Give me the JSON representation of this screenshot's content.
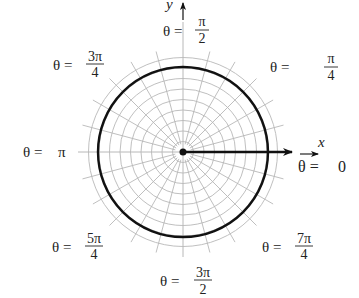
{
  "diagram": {
    "type": "polar-grid",
    "title": "",
    "axes": {
      "x_label": "x",
      "y_label": "y"
    },
    "grid": {
      "ring_count": 9,
      "spoke_step_degrees": 15
    },
    "curve": {
      "description": "circle r = constant",
      "radius_in_rings": 8.5,
      "color": "#111111"
    },
    "ray": {
      "description": "arrow along theta = 0",
      "color": "#111111"
    },
    "angle_labels": [
      {
        "id": "theta-0",
        "prefix": "θ = ",
        "value": "0",
        "fraction": false
      },
      {
        "id": "theta-pi-4",
        "prefix": "θ = ",
        "numerator": "π",
        "denominator": "4",
        "fraction": true
      },
      {
        "id": "theta-pi-2",
        "prefix": "θ = ",
        "numerator": "π",
        "denominator": "2",
        "fraction": true
      },
      {
        "id": "theta-3pi-4",
        "prefix": "θ = ",
        "numerator": "3π",
        "denominator": "4",
        "fraction": true
      },
      {
        "id": "theta-pi",
        "prefix": "θ = ",
        "value": "π",
        "fraction": false
      },
      {
        "id": "theta-5pi-4",
        "prefix": "θ = ",
        "numerator": "5π",
        "denominator": "4",
        "fraction": true
      },
      {
        "id": "theta-3pi-2",
        "prefix": "θ = ",
        "numerator": "3π",
        "denominator": "2",
        "fraction": true
      },
      {
        "id": "theta-7pi-4",
        "prefix": "θ = ",
        "numerator": "7π",
        "denominator": "4",
        "fraction": true
      }
    ],
    "colors": {
      "grid": "#b8b8b8",
      "ink": "#111111"
    }
  }
}
